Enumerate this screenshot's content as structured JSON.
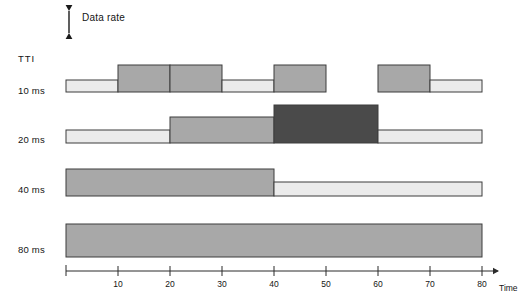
{
  "figure": {
    "datarate_label": "Data rate",
    "tti_label": "TTI",
    "axis_caption": "Time",
    "arrow_icon": "double-headed-vertical-arrow-icon"
  },
  "colors": {
    "light": "#ebebeb",
    "medium": "#a8a8a8",
    "dark": "#4a4a4a",
    "stroke": "#3d3d3d",
    "axis": "#2b2b2b",
    "background": "#ffffff"
  },
  "axis": {
    "x_min": 0,
    "x_max": 80,
    "tick_step": 10,
    "tick_labels": [
      "10",
      "20",
      "30",
      "40",
      "50",
      "60",
      "70",
      "80"
    ],
    "tick_values": [
      10,
      20,
      30,
      40,
      50,
      60,
      70,
      80
    ],
    "origin_px": 66,
    "px_per_unit": 5.2,
    "baseline_px": 271
  },
  "chart_data": {
    "type": "bar",
    "title": "",
    "xlabel": "Time",
    "ylabel": "Data rate",
    "xlim": [
      0,
      80
    ],
    "grid": false,
    "legend": null,
    "note": "Four TTI rows; each row is a piecewise-constant data-rate allocation over time. Bar height encodes data rate level, fill shade encodes level class.",
    "rows": [
      {
        "label": "10 ms",
        "tti": 10,
        "baseline_y": 92,
        "segments": [
          {
            "x0": 0,
            "x1": 10,
            "level": 1,
            "height": 12,
            "shade": "light"
          },
          {
            "x0": 10,
            "x1": 20,
            "level": 3,
            "height": 27,
            "shade": "medium"
          },
          {
            "x0": 20,
            "x1": 30,
            "level": 3,
            "height": 27,
            "shade": "medium"
          },
          {
            "x0": 30,
            "x1": 40,
            "level": 1,
            "height": 12,
            "shade": "light"
          },
          {
            "x0": 40,
            "x1": 50,
            "level": 3,
            "height": 27,
            "shade": "medium"
          },
          {
            "x0": 50,
            "x1": 60,
            "level": 0,
            "height": 0,
            "shade": "none"
          },
          {
            "x0": 60,
            "x1": 70,
            "level": 3,
            "height": 27,
            "shade": "medium"
          },
          {
            "x0": 70,
            "x1": 80,
            "level": 1,
            "height": 12,
            "shade": "light"
          }
        ]
      },
      {
        "label": "20 ms",
        "tti": 20,
        "baseline_y": 143,
        "segments": [
          {
            "x0": 0,
            "x1": 20,
            "level": 1,
            "height": 13,
            "shade": "light"
          },
          {
            "x0": 20,
            "x1": 40,
            "level": 2,
            "height": 26,
            "shade": "medium"
          },
          {
            "x0": 40,
            "x1": 60,
            "level": 4,
            "height": 38,
            "shade": "dark"
          },
          {
            "x0": 60,
            "x1": 80,
            "level": 1,
            "height": 13,
            "shade": "light"
          }
        ]
      },
      {
        "label": "40 ms",
        "tti": 40,
        "baseline_y": 196,
        "segments": [
          {
            "x0": 0,
            "x1": 40,
            "level": 3,
            "height": 27,
            "shade": "medium"
          },
          {
            "x0": 40,
            "x1": 80,
            "level": 1,
            "height": 14,
            "shade": "light"
          }
        ]
      },
      {
        "label": "80 ms",
        "tti": 80,
        "baseline_y": 257,
        "segments": [
          {
            "x0": 0,
            "x1": 80,
            "level": 3,
            "height": 33,
            "shade": "medium"
          }
        ]
      }
    ]
  }
}
